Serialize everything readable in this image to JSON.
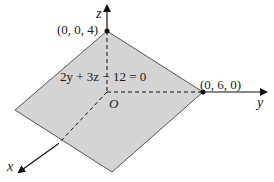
{
  "diagram": {
    "equation": "2y + 3z − 12 = 0",
    "points": {
      "z_intercept": "(0, 0, 4)",
      "y_intercept": "(0, 6, 0)"
    },
    "axes": {
      "x": "x",
      "y": "y",
      "z": "z",
      "origin": "O"
    },
    "colors": {
      "plane_fill": "#d4d4d4",
      "plane_edge": "#555555",
      "axis": "#111111"
    }
  }
}
